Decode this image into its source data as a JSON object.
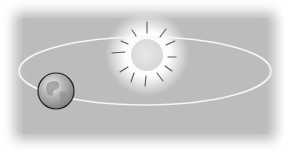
{
  "diagram": {
    "title": "",
    "colors": {
      "page_background": "#ffffff",
      "panel_background": "#bdbdbd",
      "orbit": "#f4f4f4",
      "sun_fill": "#e2e2e2",
      "sun_glow": "#ffffff",
      "sun_rays": "#555555",
      "earth_outline": "#222222",
      "earth_fill": "#a8a8a8"
    },
    "elements": [
      {
        "name": "sun",
        "label": ""
      },
      {
        "name": "earth",
        "label": ""
      },
      {
        "name": "orbit",
        "label": ""
      }
    ]
  }
}
